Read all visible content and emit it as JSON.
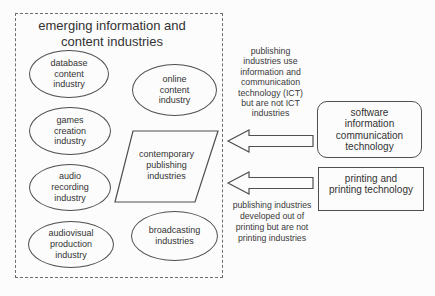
{
  "title": "emerging information and\ncontent industries",
  "ellipses": [
    {
      "name": "database-content-industry",
      "label": "database\ncontent\nindustry"
    },
    {
      "name": "online-content-industry",
      "label": "online\ncontent\nindustry"
    },
    {
      "name": "games-creation-industry",
      "label": "games\ncreation\nindustry"
    },
    {
      "name": "audio-recording-industry",
      "label": "audio\nrecording\nindustry"
    },
    {
      "name": "audiovisual-production-industry",
      "label": "audiovisual\nproduction\nindustry"
    },
    {
      "name": "broadcasting-industries",
      "label": "broadcasting\nindustries"
    }
  ],
  "parallelogram": {
    "label": "contemporary\npublishing\nindustries"
  },
  "notes": {
    "ict": "publishing\nindustries use\ninformation and\ncommunication\ntechnology (ICT)\nbut are not ICT\nindustries",
    "printing": "publishing industries\ndeveloped out of\nprinting but are not\nprinting industries"
  },
  "boxes": {
    "ict": {
      "label": "software\ninformation\ncommunication\ntechnology"
    },
    "printing": {
      "label": "printing and\nprinting technology"
    }
  },
  "colors": {
    "line": "#4f4f4f",
    "text": "#333333",
    "background": "#fcfcfc",
    "dashed_border": "#6e6e6e"
  }
}
